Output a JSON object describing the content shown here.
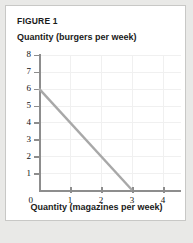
{
  "figure": {
    "label": "FIGURE 1"
  },
  "chart_data": {
    "type": "line",
    "title": "FIGURE 1",
    "ylabel": "Quantity (burgers per week)",
    "xlabel": "Quantity (magazines per week)",
    "xlim": [
      0,
      4.6
    ],
    "ylim": [
      0,
      8.4
    ],
    "grid": true,
    "legend": "none",
    "x_ticks": [
      "1",
      "2",
      "3",
      "4"
    ],
    "x_tick_values": [
      1,
      2,
      3,
      4
    ],
    "y_ticks": [
      "1",
      "2",
      "3",
      "4",
      "5",
      "6",
      "7",
      "8"
    ],
    "y_tick_values": [
      1,
      2,
      3,
      4,
      5,
      6,
      7,
      8
    ],
    "origin_label": "0",
    "series": [
      {
        "name": "budget-constraint",
        "color": "#a8a8a8",
        "x": [
          0,
          3
        ],
        "y": [
          6,
          0
        ],
        "points": [
          {
            "x": 0,
            "y": 6
          },
          {
            "x": 3,
            "y": 0
          }
        ]
      }
    ]
  },
  "colors": {
    "line": "#a8a8a8",
    "axis": "#8d8d8d",
    "grid": "#f0f0f0",
    "card_bg": "#ffffff",
    "card_border": "#c8c8c6",
    "page_bg": "#e9e9e7",
    "text": "#1a1a1a"
  }
}
